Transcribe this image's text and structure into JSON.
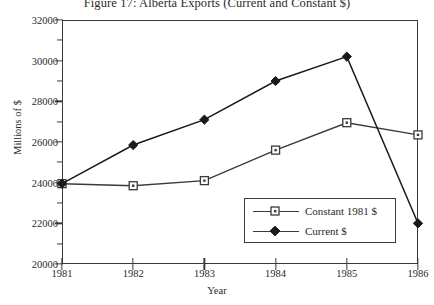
{
  "chart_data": {
    "type": "line",
    "title": "Figure 17: Alberta Exports (Current and Constant $)",
    "xlabel": "Year",
    "ylabel": "Millions of $",
    "categories": [
      1981,
      1982,
      1983,
      1984,
      1985,
      1986
    ],
    "xtick_labels": [
      "1981",
      "1982",
      "1983",
      "1984",
      "1985",
      "1986"
    ],
    "ytick_labels": [
      "20000",
      "22000",
      "24000",
      "26000",
      "28000",
      "30000",
      "32000"
    ],
    "ylim": [
      20000,
      32000
    ],
    "xlim": [
      1981,
      1986
    ],
    "ymajor_step": 2000,
    "yminor_step": 1000,
    "grid": false,
    "legend_position": "lower right",
    "series": [
      {
        "name": "Constant 1981 $",
        "marker": "open-square",
        "color": "#3a3a3a",
        "values": [
          23950,
          23850,
          24100,
          25600,
          26950,
          26350
        ]
      },
      {
        "name": "Current $",
        "marker": "filled-diamond",
        "color": "#1a1a1a",
        "values": [
          23950,
          25850,
          27100,
          29000,
          30200,
          22000
        ]
      }
    ]
  },
  "legend": {
    "items": [
      {
        "label": "Constant 1981 $"
      },
      {
        "label": "Current $"
      }
    ]
  }
}
